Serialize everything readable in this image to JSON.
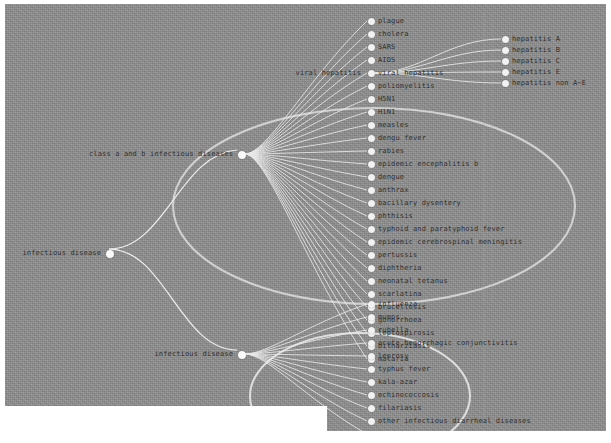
{
  "diagram": {
    "type": "edge-bundling-tree",
    "background_color": "#8e8e8e",
    "node_color": "#f2f2f2",
    "link_color": "#e8e8e8",
    "text_color": "#2b2b2b",
    "highlight_ellipse_color": "#e0e0e0"
  },
  "roots": [
    {
      "label": "infectious disease",
      "x": 104,
      "y": 249
    }
  ],
  "branches": [
    {
      "label": "class a and b infectious diseases",
      "x": 236,
      "y": 150
    },
    {
      "label": "infectious disease",
      "x": 236,
      "y": 350
    }
  ],
  "sub_branches": [
    {
      "label": "viral hepatitis",
      "x": 366,
      "y": 56
    }
  ],
  "leaves_primary": [
    {
      "label": "plague",
      "x": 366,
      "y": 17
    },
    {
      "label": "cholera",
      "x": 366,
      "y": 30
    },
    {
      "label": "SARS",
      "x": 366,
      "y": 43
    },
    {
      "label": "AIDS",
      "x": 366,
      "y": 56
    },
    {
      "label": "viral hepatitis",
      "x": 366,
      "y": 69,
      "is_branch": true
    },
    {
      "label": "poliomyelitis",
      "x": 366,
      "y": 82
    },
    {
      "label": "H5N1",
      "x": 366,
      "y": 95
    },
    {
      "label": "H1N1",
      "x": 366,
      "y": 108
    },
    {
      "label": "measles",
      "x": 366,
      "y": 121
    },
    {
      "label": "dengu fever",
      "x": 366,
      "y": 134
    },
    {
      "label": "rabies",
      "x": 366,
      "y": 147
    },
    {
      "label": "epidemic encephalitis b",
      "x": 366,
      "y": 160
    },
    {
      "label": "dengue",
      "x": 366,
      "y": 173
    },
    {
      "label": "anthrax",
      "x": 366,
      "y": 186
    },
    {
      "label": "bacillary dysentery",
      "x": 366,
      "y": 199
    },
    {
      "label": "phthisis",
      "x": 366,
      "y": 212
    },
    {
      "label": "typhoid and paratyphoid fever",
      "x": 366,
      "y": 225
    },
    {
      "label": "epidemic cerebrospinal meningitis",
      "x": 366,
      "y": 238
    },
    {
      "label": "pertussis",
      "x": 366,
      "y": 251
    },
    {
      "label": "diphtheria",
      "x": 366,
      "y": 264
    },
    {
      "label": "neonatal tetanus",
      "x": 366,
      "y": 277
    },
    {
      "label": "scarlatina",
      "x": 366,
      "y": 290
    },
    {
      "label": "brucellosis",
      "x": 366,
      "y": 303
    },
    {
      "label": "gonorrhoea",
      "x": 366,
      "y": 316
    },
    {
      "label": "leptospirosis",
      "x": 366,
      "y": 329
    },
    {
      "label": "bilharziasis",
      "x": 366,
      "y": 342
    },
    {
      "label": "malaria",
      "x": 366,
      "y": 355
    }
  ],
  "leaves_secondary": [
    {
      "label": "influenza",
      "x": 366,
      "y": 17
    },
    {
      "label": "mumps",
      "x": 366,
      "y": 30
    },
    {
      "label": "rubella",
      "x": 366,
      "y": 43
    },
    {
      "label": "acute hemorrhagic conjunctivitis",
      "x": 366,
      "y": 56
    },
    {
      "label": "leprosy",
      "x": 366,
      "y": 69
    },
    {
      "label": "typhus fever",
      "x": 366,
      "y": 82
    },
    {
      "label": "kala-azar",
      "x": 366,
      "y": 95
    },
    {
      "label": "echinococcosis",
      "x": 366,
      "y": 108
    },
    {
      "label": "filariasis",
      "x": 366,
      "y": 121
    },
    {
      "label": "other infectious diarrheal diseases",
      "x": 366,
      "y": 134
    },
    {
      "label": "hand-foot-and-mouth disease",
      "x": 366,
      "y": 147
    }
  ],
  "leaves_hepatitis": [
    {
      "label": "hepatitis A",
      "x": 500,
      "y": 35
    },
    {
      "label": "hepatitis B",
      "x": 500,
      "y": 46
    },
    {
      "label": "hepatitis C",
      "x": 500,
      "y": 57
    },
    {
      "label": "hepatitis E",
      "x": 500,
      "y": 68
    },
    {
      "label": "hepatitis non A~E",
      "x": 500,
      "y": 79
    }
  ]
}
